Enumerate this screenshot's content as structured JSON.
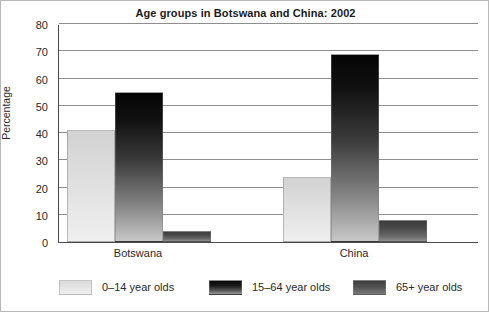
{
  "chart_data": {
    "type": "bar",
    "title": "Age groups in Botswana and China: 2002",
    "xlabel": "",
    "ylabel": "Percentage",
    "categories": [
      "Botswana",
      "China"
    ],
    "series": [
      {
        "name": "0–14 year olds",
        "values": [
          41,
          24
        ],
        "color": "#e3e3e3"
      },
      {
        "name": "15–64 year olds",
        "values": [
          55,
          69
        ],
        "color": "#141414"
      },
      {
        "name": "65+ year olds",
        "values": [
          4,
          8
        ],
        "color": "#4d4d4d"
      }
    ],
    "ylim": [
      0,
      80
    ],
    "yticks": [
      0,
      10,
      20,
      30,
      40,
      50,
      60,
      70,
      80
    ],
    "ytick_labels": [
      "0",
      "10",
      "20",
      "30",
      "40",
      "50",
      "60",
      "70",
      "80"
    ],
    "grid": true,
    "grid_axis": "y",
    "legend_position": "bottom",
    "bar_group_gap": true
  }
}
